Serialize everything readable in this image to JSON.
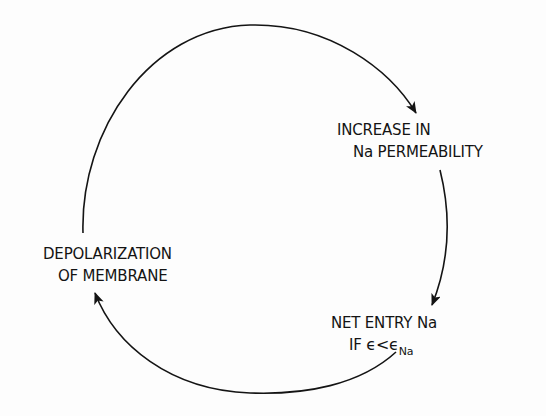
{
  "diagram": {
    "type": "cycle",
    "colors": {
      "line": "#141414",
      "background": "#fdfdfd"
    },
    "nodes": [
      {
        "id": "increase-permeability",
        "lines": [
          "INCREASE IN",
          "Na PERMEABILITY"
        ]
      },
      {
        "id": "net-entry",
        "lines": [
          "NET ENTRY Na"
        ],
        "condition": {
          "prefix": "IF",
          "lhs": "ϵ",
          "op": "<",
          "rhs": "ϵ",
          "rhs_subscript": "Na"
        }
      },
      {
        "id": "depolarization",
        "lines": [
          "DEPOLARIZATION",
          "OF MEMBRANE"
        ]
      }
    ],
    "edges": [
      {
        "from": "depolarization",
        "to": "increase-permeability",
        "icon": "arrow-icon"
      },
      {
        "from": "increase-permeability",
        "to": "net-entry",
        "icon": "arrow-icon"
      },
      {
        "from": "net-entry",
        "to": "depolarization",
        "icon": "arrow-icon"
      }
    ]
  }
}
